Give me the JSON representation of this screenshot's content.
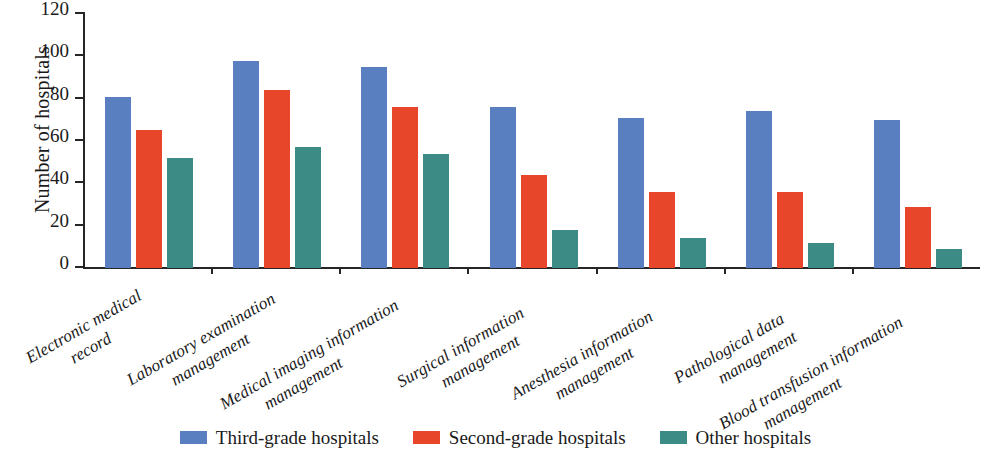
{
  "chart_data": {
    "type": "bar",
    "title": "",
    "xlabel": "",
    "ylabel": "Number of hospitals",
    "ylim": [
      0,
      120
    ],
    "yticks": [
      0,
      20,
      40,
      60,
      80,
      100,
      120
    ],
    "grid": false,
    "legend_position": "bottom",
    "categories": [
      "Electronic medical record",
      "Laboratory examination management",
      "Medical imaging information management",
      "Surgical information management",
      "Anesthesia information management",
      "Pathological data management",
      "Blood transfusion information management"
    ],
    "category_lines": [
      [
        "Electronic medical",
        "record"
      ],
      [
        "Laboratory examination",
        "management"
      ],
      [
        "Medical imaging information",
        "management"
      ],
      [
        "Surgical information",
        "management"
      ],
      [
        "Anesthesia information",
        "management"
      ],
      [
        "Pathological data",
        "management"
      ],
      [
        "Blood transfusion information",
        "management"
      ]
    ],
    "series": [
      {
        "name": "Third-grade hospitals",
        "color": "#5a7fc0",
        "values": [
          81,
          98,
          95,
          76,
          71,
          74,
          70
        ]
      },
      {
        "name": "Second-grade hospitals",
        "color": "#e8462a",
        "values": [
          65,
          84,
          76,
          44,
          36,
          36,
          29
        ]
      },
      {
        "name": "Other hospitals",
        "color": "#3d8b85",
        "values": [
          52,
          57,
          54,
          18,
          14,
          12,
          9
        ]
      }
    ]
  },
  "axis": {
    "y_title": "Number of hospitals"
  },
  "legend": {
    "items": [
      {
        "label": "Third-grade hospitals",
        "color": "#5a7fc0"
      },
      {
        "label": "Second-grade hospitals",
        "color": "#e8462a"
      },
      {
        "label": "Other hospitals",
        "color": "#3d8b85"
      }
    ]
  }
}
